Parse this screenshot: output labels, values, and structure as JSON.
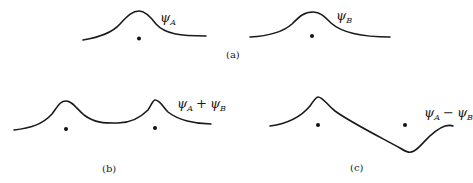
{
  "figure": {
    "panel_a": {
      "caption": "(a)",
      "left": {
        "label_symbol": "ψ",
        "label_subscript": "A"
      },
      "right": {
        "label_symbol": "ψ",
        "label_subscript": "B"
      }
    },
    "panel_b": {
      "caption": "(b)",
      "label": {
        "sym1": "ψ",
        "sub1": "A",
        "op": "+",
        "sym2": "ψ",
        "sub2": "B"
      }
    },
    "panel_c": {
      "caption": "(c)",
      "label": {
        "sym1": "ψ",
        "sub1": "A",
        "op": "−",
        "sym2": "ψ",
        "sub2": "B"
      }
    }
  }
}
